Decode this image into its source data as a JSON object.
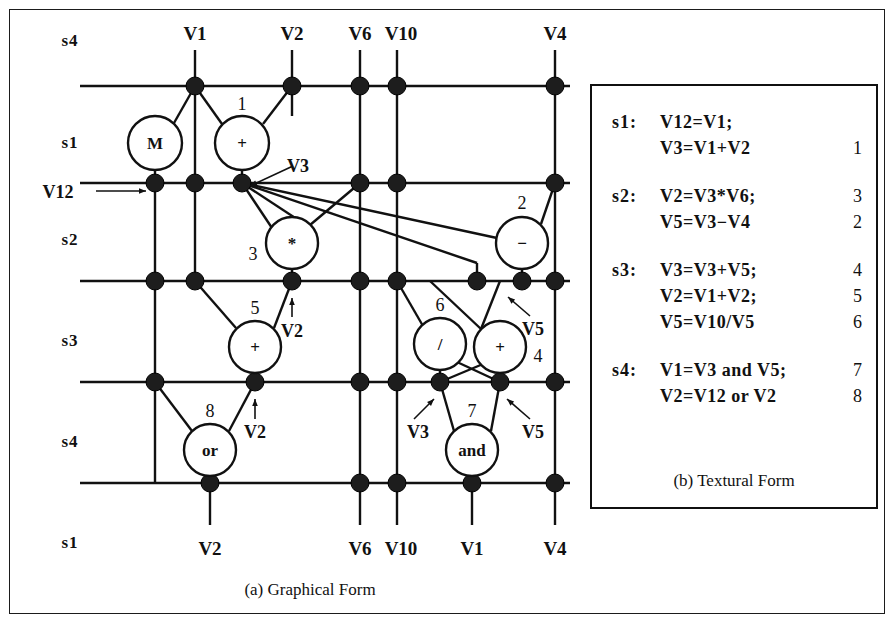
{
  "figure": {
    "caption_a": "(a) Graphical Form",
    "caption_b": "(b) Textural Form"
  },
  "graph": {
    "top_column_labels": [
      {
        "text": "V1",
        "x": 185,
        "y": 30
      },
      {
        "text": "V2",
        "x": 282,
        "y": 30
      },
      {
        "text": "V6",
        "x": 350,
        "y": 30
      },
      {
        "text": "V10",
        "x": 391,
        "y": 30
      },
      {
        "text": "V4",
        "x": 545,
        "y": 30
      }
    ],
    "bottom_column_labels": [
      {
        "text": "V2",
        "x": 200,
        "y": 545
      },
      {
        "text": "V6",
        "x": 350,
        "y": 545
      },
      {
        "text": "V10",
        "x": 391,
        "y": 545
      },
      {
        "text": "V1",
        "x": 462,
        "y": 545
      },
      {
        "text": "V4",
        "x": 545,
        "y": 545
      }
    ],
    "stage_labels": [
      {
        "text": "s4",
        "x": 60,
        "y": 36
      },
      {
        "text": "s1",
        "x": 60,
        "y": 138
      },
      {
        "text": "s2",
        "x": 60,
        "y": 235
      },
      {
        "text": "s3",
        "x": 60,
        "y": 336
      },
      {
        "text": "s4",
        "x": 60,
        "y": 437
      },
      {
        "text": "s1",
        "x": 60,
        "y": 538
      }
    ],
    "operator_nodes": [
      {
        "symbol": "M",
        "index": "",
        "cx": 145,
        "cy": 133,
        "r": 27,
        "index_x": 0,
        "index_y": 0
      },
      {
        "symbol": "+",
        "index": "1",
        "cx": 232,
        "cy": 133,
        "r": 27,
        "index_x": 232,
        "index_y": 100
      },
      {
        "symbol": "*",
        "index": "3",
        "cx": 282,
        "cy": 233,
        "r": 26,
        "index_x": 243,
        "index_y": 250
      },
      {
        "symbol": "−",
        "index": "2",
        "cx": 512,
        "cy": 233,
        "r": 26,
        "index_x": 512,
        "index_y": 199
      },
      {
        "symbol": "+",
        "index": "5",
        "cx": 245,
        "cy": 337,
        "r": 26,
        "index_x": 245,
        "index_y": 304
      },
      {
        "symbol": "/",
        "index": "6",
        "cx": 430,
        "cy": 334,
        "r": 26,
        "index_x": 430,
        "index_y": 301
      },
      {
        "symbol": "+",
        "index": "4",
        "cx": 490,
        "cy": 337,
        "r": 26,
        "index_x": 528,
        "index_y": 352
      },
      {
        "symbol": "or",
        "index": "8",
        "cx": 200,
        "cy": 440,
        "r": 26,
        "index_x": 200,
        "index_y": 407
      },
      {
        "symbol": "and",
        "index": "7",
        "cx": 462,
        "cy": 440,
        "r": 26,
        "index_x": 462,
        "index_y": 407
      }
    ],
    "annotations": [
      {
        "text": "V12",
        "tx": 48,
        "ty": 188,
        "ax1": 86,
        "ay1": 181,
        "ax2": 136,
        "ay2": 181
      },
      {
        "text": "V3",
        "tx": 288,
        "ty": 162,
        "ax1": 283,
        "ay1": 156,
        "ax2": 240,
        "ay2": 176
      },
      {
        "text": "V2",
        "tx": 282,
        "ty": 327,
        "ax1": 282,
        "ay1": 307,
        "ax2": 282,
        "ay2": 288
      },
      {
        "text": "V5",
        "tx": 523,
        "ty": 325,
        "ax1": 520,
        "ay1": 306,
        "ax2": 498,
        "ay2": 287
      },
      {
        "text": "V2",
        "tx": 245,
        "ty": 428,
        "ax1": 245,
        "ay1": 409,
        "ax2": 245,
        "ay2": 389
      },
      {
        "text": "V3",
        "tx": 408,
        "ty": 428,
        "ax1": 404,
        "ay1": 409,
        "ax2": 424,
        "ay2": 389
      },
      {
        "text": "V5",
        "tx": 523,
        "ty": 428,
        "ax1": 520,
        "ay1": 409,
        "ax2": 497,
        "ay2": 389
      }
    ]
  },
  "text_panel": {
    "groups": [
      {
        "stage": "s1:",
        "rows": [
          {
            "stmt": "V12=V1;",
            "index": ""
          },
          {
            "stmt": "V3=V1+V2",
            "index": "1"
          }
        ]
      },
      {
        "stage": "s2:",
        "rows": [
          {
            "stmt": "V2=V3*V6;",
            "index": "3"
          },
          {
            "stmt": "V5=V3−V4",
            "index": "2"
          }
        ]
      },
      {
        "stage": "s3:",
        "rows": [
          {
            "stmt": "V3=V3+V5;",
            "index": "4"
          },
          {
            "stmt": "V2=V1+V2;",
            "index": "5"
          },
          {
            "stmt": "V5=V10/V5",
            "index": "6"
          }
        ]
      },
      {
        "stage": "s4:",
        "rows": [
          {
            "stmt": "V1=V3 and V5;",
            "index": "7"
          },
          {
            "stmt": "V2=V12 or V2",
            "index": "8"
          }
        ]
      }
    ]
  },
  "colors": {
    "ink": "#111111",
    "paper": "#ffffff",
    "node_fill": "#1d1d1d"
  }
}
